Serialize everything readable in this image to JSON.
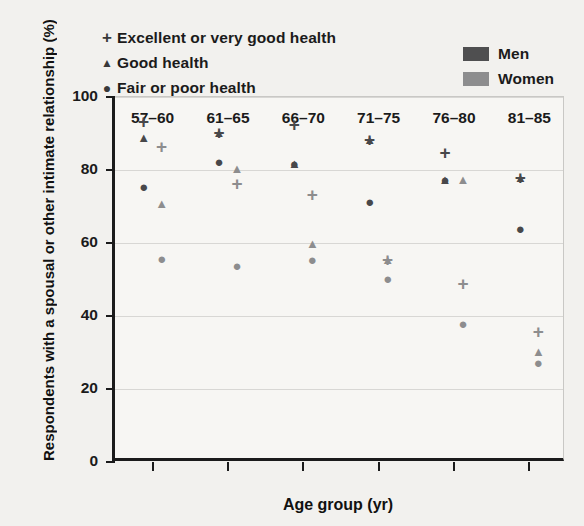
{
  "legend_health": [
    {
      "marker": "plus-icon",
      "glyph": "+",
      "label": "Excellent or very good health"
    },
    {
      "marker": "triangle-icon",
      "glyph": "▲",
      "label": "Good health"
    },
    {
      "marker": "circle-icon",
      "glyph": "●",
      "label": "Fair or poor health"
    }
  ],
  "legend_sex": [
    {
      "label": "Men",
      "color": "#4f4f50"
    },
    {
      "label": "Women",
      "color": "#8d8d8e"
    }
  ],
  "chart_data": {
    "type": "scatter",
    "title": "",
    "xlabel": "Age group (yr)",
    "ylabel": "Respondents with a spousal or other intimate relationship (%)",
    "categories": [
      "57–60",
      "61–65",
      "66–70",
      "71–75",
      "76–80",
      "81–85"
    ],
    "ylim": [
      0,
      100
    ],
    "yticks": [
      0,
      20,
      40,
      60,
      80,
      100
    ],
    "grid": true,
    "legend_position": "top-left and top-right",
    "series": [
      {
        "name": "Men — Excellent or very good health",
        "sex": "Men",
        "health": "Excellent or very good health",
        "marker": "plus",
        "color": "#48484a",
        "values": [
          93.5,
          90.5,
          92.5,
          88.5,
          85.0,
          78.0
        ]
      },
      {
        "name": "Men — Good health",
        "sex": "Men",
        "health": "Good health",
        "marker": "triangle",
        "color": "#48484a",
        "values": [
          89.0,
          90.5,
          82.0,
          88.5,
          77.5,
          78.0
        ]
      },
      {
        "name": "Men — Fair or poor health",
        "sex": "Men",
        "health": "Fair or poor health",
        "marker": "circle",
        "color": "#48484a",
        "values": [
          75.5,
          82.5,
          82.0,
          71.5,
          77.5,
          64.0
        ]
      },
      {
        "name": "Women — Excellent or very good health",
        "sex": "Women",
        "health": "Excellent or very good health",
        "marker": "plus",
        "color": "#8d8d8e",
        "values": [
          86.5,
          76.5,
          73.5,
          55.5,
          49.0,
          36.0
        ]
      },
      {
        "name": "Women — Good health",
        "sex": "Women",
        "health": "Good health",
        "marker": "triangle",
        "color": "#8d8d8e",
        "values": [
          71.0,
          80.5,
          60.0,
          55.5,
          77.5,
          30.5
        ]
      },
      {
        "name": "Women — Fair or poor health",
        "sex": "Women",
        "health": "Fair or poor health",
        "marker": "circle",
        "color": "#8d8d8e",
        "values": [
          56.0,
          54.0,
          55.5,
          50.5,
          38.0,
          27.5
        ]
      }
    ]
  }
}
